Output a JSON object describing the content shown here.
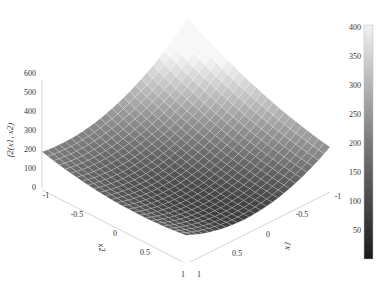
{
  "chart_data": {
    "type": "surface3d",
    "title": "",
    "zlabel": "f2(x1, x2)",
    "xlabel": "x1",
    "ylabel": "x2",
    "x_ticks": [
      "1",
      "0.5",
      "0",
      "-0.5",
      "-1"
    ],
    "y_ticks": [
      "-1",
      "-0.5",
      "0",
      "0.5",
      "1"
    ],
    "z_ticks": [
      "0",
      "100",
      "200",
      "300",
      "400",
      "500",
      "600"
    ],
    "xlim": [
      -1,
      1
    ],
    "ylim": [
      -1,
      1
    ],
    "zlim": [
      0,
      600
    ],
    "colormap": "gray",
    "colorbar": {
      "ticks": [
        "50",
        "100",
        "150",
        "200",
        "250",
        "300",
        "350",
        "400"
      ],
      "range": [
        5,
        405
      ]
    },
    "corners": {
      "x1=-1,x2=-1": 440,
      "x1=1,x2=-1": 330,
      "x1=1,x2=1": 20,
      "x1=-1,x2=1": 60
    },
    "grid_resolution": 25,
    "grid": "on"
  }
}
